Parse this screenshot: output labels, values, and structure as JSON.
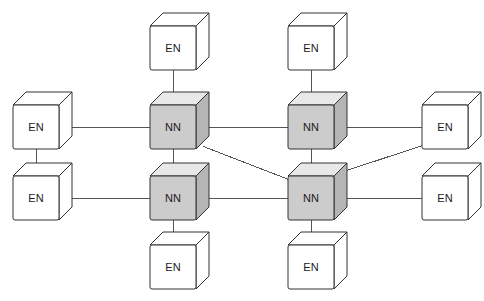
{
  "diagram": {
    "type": "network-topology",
    "title": "",
    "background_color": "#ffffff",
    "link_color": "#555555",
    "link_width": 1,
    "node_types": {
      "EN": {
        "code": "EN",
        "name": "End Node",
        "face_fill": "#ffffff",
        "top_fill": "#ffffff",
        "side_fill": "#ffffff",
        "stroke": "#333333"
      },
      "NN": {
        "code": "NN",
        "name": "Network Node",
        "face_fill": "#cccccc",
        "top_fill": "#e8e8e8",
        "side_fill": "#b5b5b5",
        "stroke": "#333333"
      }
    },
    "cube": {
      "face_width": 46,
      "face_height": 44,
      "depth_x": 13,
      "depth_y": 13
    },
    "nodes": [
      {
        "id": "en-top-left",
        "label": "EN",
        "type": "EN",
        "x": 150,
        "y": 13
      },
      {
        "id": "en-top-right",
        "label": "EN",
        "type": "EN",
        "x": 288,
        "y": 13
      },
      {
        "id": "en-left-upper",
        "label": "EN",
        "type": "EN",
        "x": 13,
        "y": 92
      },
      {
        "id": "nn-top-left",
        "label": "NN",
        "type": "NN",
        "x": 150,
        "y": 92
      },
      {
        "id": "nn-top-right",
        "label": "NN",
        "type": "NN",
        "x": 288,
        "y": 92
      },
      {
        "id": "en-right-upper",
        "label": "EN",
        "type": "EN",
        "x": 422,
        "y": 92
      },
      {
        "id": "en-left-lower",
        "label": "EN",
        "type": "EN",
        "x": 13,
        "y": 163
      },
      {
        "id": "nn-bottom-left",
        "label": "NN",
        "type": "NN",
        "x": 150,
        "y": 163
      },
      {
        "id": "nn-bottom-right",
        "label": "NN",
        "type": "NN",
        "x": 288,
        "y": 163
      },
      {
        "id": "en-right-lower",
        "label": "EN",
        "type": "EN",
        "x": 422,
        "y": 163
      },
      {
        "id": "en-bottom-left",
        "label": "EN",
        "type": "EN",
        "x": 150,
        "y": 232
      },
      {
        "id": "en-bottom-right",
        "label": "EN",
        "type": "EN",
        "x": 288,
        "y": 232
      }
    ],
    "links": [
      {
        "id": "link-en-top-left--nn-top-left",
        "from": "en-top-left",
        "to": "nn-top-left",
        "kind": "vertical"
      },
      {
        "id": "link-en-top-right--nn-top-right",
        "from": "en-top-right",
        "to": "nn-top-right",
        "kind": "vertical"
      },
      {
        "id": "link-en-left-upper--nn-top-left",
        "from": "en-left-upper",
        "to": "nn-top-left",
        "kind": "horizontal"
      },
      {
        "id": "link-nn-top-left--nn-top-right",
        "from": "nn-top-left",
        "to": "nn-top-right",
        "kind": "horizontal"
      },
      {
        "id": "link-nn-top-right--en-right-upper",
        "from": "nn-top-right",
        "to": "en-right-upper",
        "kind": "horizontal"
      },
      {
        "id": "link-en-left-upper--en-left-lower",
        "from": "en-left-upper",
        "to": "en-left-lower",
        "kind": "vertical"
      },
      {
        "id": "link-nn-top-left--nn-bottom-left",
        "from": "nn-top-left",
        "to": "nn-bottom-left",
        "kind": "vertical"
      },
      {
        "id": "link-nn-top-right--nn-bottom-right",
        "from": "nn-top-right",
        "to": "nn-bottom-right",
        "kind": "vertical"
      },
      {
        "id": "link-en-left-lower--nn-bottom-left",
        "from": "en-left-lower",
        "to": "nn-bottom-left",
        "kind": "horizontal"
      },
      {
        "id": "link-nn-bottom-left--nn-bottom-right",
        "from": "nn-bottom-left",
        "to": "nn-bottom-right",
        "kind": "horizontal"
      },
      {
        "id": "link-nn-bottom-right--en-right-lower",
        "from": "nn-bottom-right",
        "to": "en-right-lower",
        "kind": "horizontal"
      },
      {
        "id": "link-nn-bottom-left--en-bottom-left",
        "from": "nn-bottom-left",
        "to": "en-bottom-left",
        "kind": "vertical"
      },
      {
        "id": "link-nn-bottom-right--en-bottom-right",
        "from": "nn-bottom-right",
        "to": "en-bottom-right",
        "kind": "vertical"
      },
      {
        "id": "link-nn-top-left--nn-bottom-right",
        "from": "nn-top-left",
        "to": "nn-bottom-right",
        "kind": "diagonal"
      },
      {
        "id": "link-nn-bottom-right--en-right-upper",
        "from": "nn-bottom-right",
        "to": "en-right-upper",
        "kind": "diagonal"
      }
    ]
  }
}
